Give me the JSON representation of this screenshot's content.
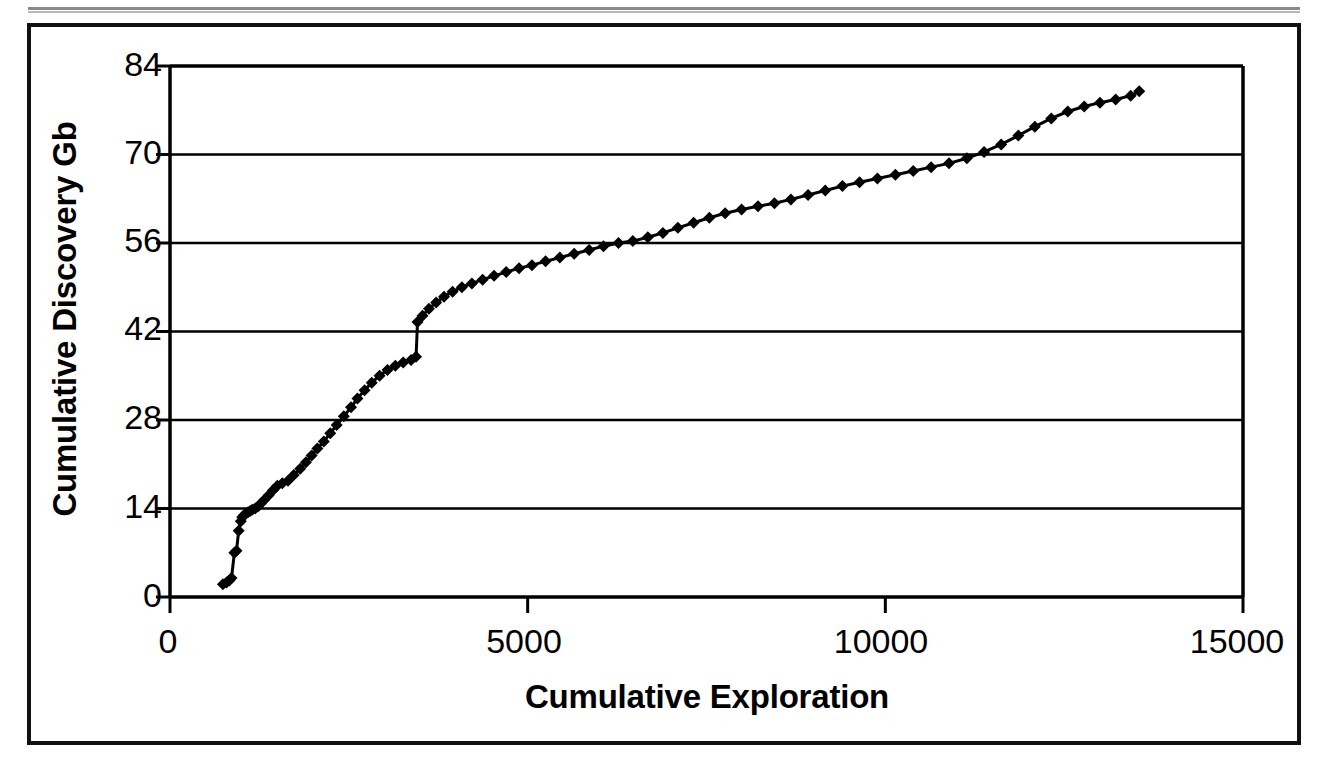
{
  "figure": {
    "border_color": "#111111",
    "background": "#ffffff",
    "series_color": "#000000"
  },
  "chart_data": {
    "type": "line",
    "title": "",
    "subtitle": "",
    "xlabel": "Cumulative Exploration",
    "ylabel": "Cumulative Discovery Gb",
    "xlim": [
      0,
      15000
    ],
    "ylim": [
      0,
      84
    ],
    "xticks": [
      0,
      5000,
      10000,
      15000
    ],
    "xtick_labels": [
      "0",
      "5000",
      "10000",
      "15000"
    ],
    "yticks": [
      0,
      14,
      28,
      42,
      56,
      70,
      84
    ],
    "ytick_labels": [
      "0",
      "14",
      "28",
      "42",
      "56",
      "70",
      "84"
    ],
    "grid": "horizontal",
    "legend": "none",
    "marker": "diamond",
    "marker_size": 12,
    "line_width": 3,
    "annotations": [],
    "series": [
      {
        "name": "Cumulative Discovery",
        "x": [
          740,
          790,
          830,
          860,
          900,
          930,
          960,
          990,
          1010,
          1030,
          1060,
          1090,
          1120,
          1150,
          1190,
          1230,
          1270,
          1320,
          1380,
          1440,
          1500,
          1570,
          1650,
          1730,
          1820,
          1900,
          1980,
          2060,
          2150,
          2240,
          2330,
          2430,
          2530,
          2620,
          2720,
          2820,
          2930,
          3040,
          3150,
          3260,
          3370,
          3440,
          3460,
          3530,
          3620,
          3720,
          3830,
          3950,
          4080,
          4220,
          4370,
          4530,
          4700,
          4880,
          5060,
          5250,
          5450,
          5650,
          5860,
          6060,
          6270,
          6470,
          6680,
          6890,
          7100,
          7320,
          7540,
          7760,
          7990,
          8220,
          8450,
          8680,
          8920,
          9160,
          9400,
          9640,
          9890,
          10140,
          10390,
          10640,
          10890,
          11140,
          11380,
          11620,
          11860,
          12090,
          12320,
          12550,
          12780,
          13000,
          13220,
          13430,
          13550
        ],
        "y": [
          2.0,
          2.3,
          2.6,
          3.0,
          7.0,
          7.3,
          10.5,
          12.0,
          12.6,
          12.9,
          13.2,
          13.4,
          13.6,
          13.8,
          14.0,
          14.3,
          14.8,
          15.4,
          16.1,
          16.9,
          17.6,
          18.0,
          18.4,
          19.3,
          20.3,
          21.3,
          22.4,
          23.5,
          24.6,
          25.9,
          27.2,
          28.6,
          30.0,
          31.4,
          32.7,
          33.9,
          35.0,
          35.9,
          36.6,
          37.1,
          37.5,
          38.0,
          43.5,
          44.5,
          45.6,
          46.6,
          47.5,
          48.3,
          49.0,
          49.6,
          50.2,
          50.8,
          51.4,
          52.0,
          52.5,
          53.1,
          53.7,
          54.3,
          54.9,
          55.5,
          56.0,
          56.3,
          56.9,
          57.6,
          58.4,
          59.2,
          60.0,
          60.7,
          61.3,
          61.8,
          62.3,
          62.9,
          63.6,
          64.3,
          65.0,
          65.6,
          66.2,
          66.8,
          67.4,
          68.0,
          68.6,
          69.4,
          70.4,
          71.6,
          73.0,
          74.4,
          75.7,
          76.8,
          77.6,
          78.2,
          78.7,
          79.3,
          80.0
        ]
      }
    ]
  }
}
